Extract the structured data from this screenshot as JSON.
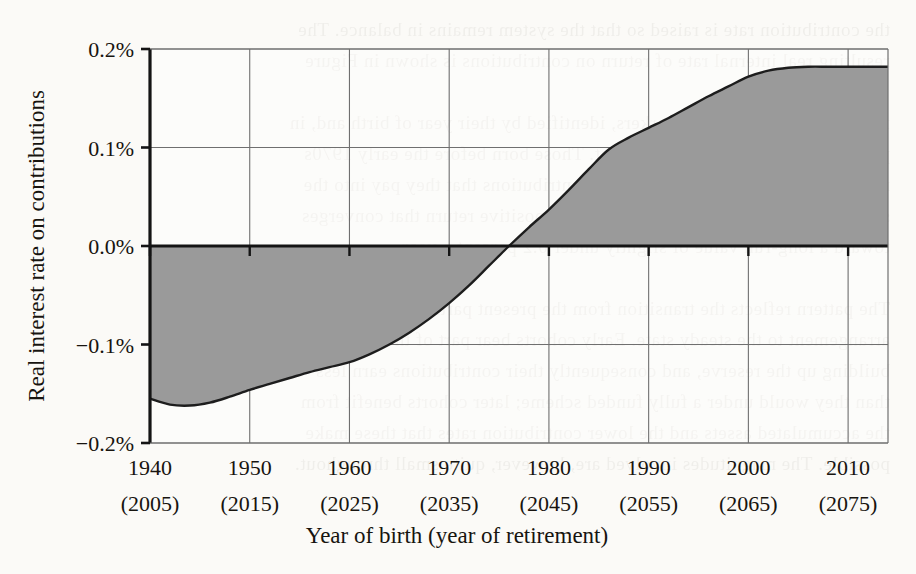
{
  "figure": {
    "background_color": "#fbfaf7",
    "area_fill_color": "#9a9a9a",
    "line_color": "#1d1d1d",
    "grid_color": "#6f6f6f",
    "axis_color": "#141414"
  },
  "axes": {
    "x_title": "Year of birth (year of retirement)",
    "y_title": "Real interest rate on contributions"
  },
  "bleed_text": "the contribution rate is raised so that the system remains in balance. The\nresulting real internal rate of return on contributions is shown in Figure\n\nfor successive cohorts of workers, identified by their year of birth and, in\nparentheses, their year of retirement. Those born before the early 1970s\nreceive a negative real return on the contributions that they pay into the\nsystem, while later cohorts obtain a small positive return that converges\ntoward a long-run value of slightly under 0.2 percent a year.\n\nThe pattern reflects the transition from the present partially funded\narrangement to the steady state. Early cohorts bear part of the cost of\nbuilding up the reserve, and consequently their contributions earn less\nthan they would under a fully funded scheme; later cohorts benefit from\nthe accumulated assets and the lower contribution rates that these make\npossible. The magnitudes involved are, however, quite small throughout.",
  "chart_data": {
    "type": "area",
    "title": "",
    "xlabel": "Year of birth (year of retirement)",
    "ylabel": "Real interest rate on contributions",
    "xlim": [
      1940,
      2014
    ],
    "ylim": [
      -0.2,
      0.2
    ],
    "grid": true,
    "legend": null,
    "baseline": 0.0,
    "y_ticks": [
      0.2,
      0.1,
      0.0,
      -0.1,
      -0.2
    ],
    "y_tick_labels": [
      "0.2%",
      "0.1%",
      "0.0%",
      "−0.1%",
      "−0.2%"
    ],
    "x_ticks": [
      1940,
      1950,
      1960,
      1970,
      1980,
      1990,
      2000,
      2010
    ],
    "x_tick_labels": [
      "1940",
      "1950",
      "1960",
      "1970",
      "1980",
      "1990",
      "2000",
      "2010"
    ],
    "x_tick_sublabels": [
      "(2005)",
      "(2015)",
      "(2025)",
      "(2035)",
      "(2045)",
      "(2055)",
      "(2065)",
      "(2075)"
    ],
    "x": [
      1940,
      1942,
      1944,
      1946,
      1948,
      1950,
      1952,
      1954,
      1956,
      1958,
      1960,
      1962,
      1964,
      1966,
      1968,
      1970,
      1972,
      1974,
      1976,
      1978,
      1980,
      1982,
      1984,
      1986,
      1988,
      1990,
      1992,
      1994,
      1996,
      1998,
      2000,
      2002,
      2004,
      2006,
      2008,
      2010,
      2012,
      2014
    ],
    "values": [
      -0.155,
      -0.161,
      -0.162,
      -0.159,
      -0.153,
      -0.146,
      -0.14,
      -0.134,
      -0.128,
      -0.123,
      -0.118,
      -0.11,
      -0.1,
      -0.088,
      -0.074,
      -0.058,
      -0.04,
      -0.02,
      0.0,
      0.019,
      0.037,
      0.057,
      0.078,
      0.098,
      0.11,
      0.12,
      0.13,
      0.141,
      0.152,
      0.162,
      0.172,
      0.178,
      0.181,
      0.182,
      0.182,
      0.182,
      0.182,
      0.182
    ],
    "units": "percent per year"
  }
}
